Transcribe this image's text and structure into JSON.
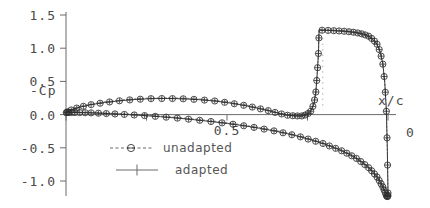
{
  "chart_data": {
    "type": "line",
    "title": "",
    "xlabel": "x/c",
    "ylabel": "-Cp",
    "xlim": [
      1.0,
      0.0
    ],
    "ylim": [
      -1.3,
      1.6
    ],
    "x_reversed": true,
    "grid": false,
    "legend_position": "bottom-center",
    "x_ticks": [
      1.0,
      0.75,
      0.5,
      0.25,
      0.0
    ],
    "x_tick_labels": [
      "",
      "",
      "0.5",
      "",
      "0"
    ],
    "y_ticks": [
      1.5,
      1.0,
      0.5,
      0.0,
      -0.5,
      -1.0
    ],
    "y_tick_labels": [
      "1.5",
      "1.0",
      "0.5",
      "0.0",
      "-0.5",
      "-1.0"
    ],
    "series": [
      {
        "name": "unadapted",
        "marker": "circle",
        "linestyle": "dashed",
        "color": "#4a4a4a"
      },
      {
        "name": "adapted",
        "marker": "plus",
        "linestyle": "solid",
        "color": "#3a3a3a"
      }
    ],
    "upper_surface": {
      "comment": "suction side, -Cp, x/c from 0 (LE, right) to 1.0 (TE, left); shock near x/c=0.22",
      "x": [
        0.0,
        0.002,
        0.005,
        0.01,
        0.016,
        0.024,
        0.034,
        0.046,
        0.06,
        0.076,
        0.094,
        0.114,
        0.136,
        0.16,
        0.186,
        0.214,
        0.216,
        0.22,
        0.224,
        0.23,
        0.24,
        0.252,
        0.268,
        0.288,
        0.312,
        0.34,
        0.372,
        0.408,
        0.448,
        0.492,
        0.538,
        0.586,
        0.636,
        0.686,
        0.736,
        0.786,
        0.834,
        0.88,
        0.922,
        0.958,
        0.984,
        1.0
      ],
      "y": [
        -1.18,
        -0.55,
        0.05,
        0.48,
        0.76,
        0.94,
        1.06,
        1.13,
        1.18,
        1.21,
        1.23,
        1.245,
        1.255,
        1.262,
        1.268,
        1.272,
        0.92,
        0.6,
        0.34,
        0.16,
        0.05,
        0.0,
        -0.02,
        -0.02,
        -0.01,
        0.02,
        0.06,
        0.1,
        0.14,
        0.175,
        0.205,
        0.225,
        0.238,
        0.243,
        0.24,
        0.228,
        0.208,
        0.182,
        0.15,
        0.112,
        0.07,
        0.03
      ]
    },
    "lower_surface": {
      "comment": "pressure side, -Cp, x/c from 0 (LE, right) to 1.0 (TE, left)",
      "x": [
        0.0,
        0.002,
        0.005,
        0.01,
        0.016,
        0.024,
        0.034,
        0.046,
        0.06,
        0.078,
        0.098,
        0.12,
        0.144,
        0.172,
        0.202,
        0.236,
        0.272,
        0.312,
        0.354,
        0.4,
        0.448,
        0.498,
        0.55,
        0.602,
        0.654,
        0.706,
        0.756,
        0.804,
        0.848,
        0.888,
        0.922,
        0.95,
        0.972,
        0.988,
        0.997,
        1.0
      ],
      "y": [
        -1.22,
        -1.24,
        -1.22,
        -1.16,
        -1.09,
        -1.02,
        -0.94,
        -0.87,
        -0.8,
        -0.73,
        -0.66,
        -0.6,
        -0.545,
        -0.49,
        -0.435,
        -0.385,
        -0.335,
        -0.288,
        -0.245,
        -0.205,
        -0.168,
        -0.134,
        -0.104,
        -0.077,
        -0.053,
        -0.032,
        -0.015,
        -0.001,
        0.01,
        0.019,
        0.026,
        0.03,
        0.032,
        0.032,
        0.031,
        0.03
      ]
    },
    "shock": {
      "x": 0.215,
      "y_top": 1.272,
      "y_bottom": -0.02,
      "label": "shock"
    }
  },
  "legend": {
    "entries": [
      {
        "label": "unadapted",
        "marker": "circle",
        "style": "dashed"
      },
      {
        "label": "adapted",
        "marker": "plus",
        "style": "solid"
      }
    ]
  },
  "axes": {
    "y_axis_title": "-Cp",
    "x_axis_title": "x/c"
  }
}
